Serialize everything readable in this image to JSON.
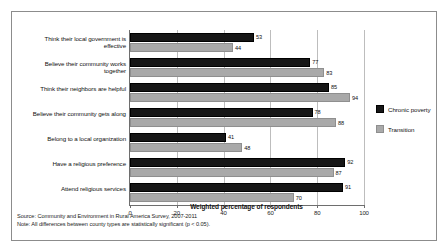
{
  "chart_data": {
    "type": "bar",
    "orientation": "horizontal",
    "title": "",
    "xlabel": "Weighted percentage of respondents",
    "ylabel": "",
    "xlim": [
      0,
      100
    ],
    "xticks": [
      0,
      20,
      40,
      60,
      80,
      100
    ],
    "grid": true,
    "legend_position": "right",
    "categories": [
      "Think their local government is effective",
      "Believe their community works together",
      "Think their neighbors are helpful",
      "Believe their community gets along",
      "Belong to a local organization",
      "Have a religious preference",
      "Attend religious services"
    ],
    "series": [
      {
        "name": "Chronic poverty",
        "color": "#161616",
        "values": [
          53,
          77,
          85,
          78,
          41,
          92,
          91
        ]
      },
      {
        "name": "Transition",
        "color": "#a9a9a9",
        "values": [
          44,
          83,
          94,
          88,
          48,
          87,
          70
        ]
      }
    ]
  },
  "axis": {
    "tick_labels": [
      "0",
      "20",
      "40",
      "60",
      "80",
      "100"
    ],
    "x_title": "Weighted percentage of respondents"
  },
  "legend": {
    "items": [
      {
        "label": "Chronic poverty"
      },
      {
        "label": "Transition"
      }
    ]
  },
  "footnotes": {
    "source": "Source: Community and Environment in Rural America  Survey, 2007-2011",
    "note": "Note: All differences between county types are statistically significant (p < 0.05)."
  }
}
